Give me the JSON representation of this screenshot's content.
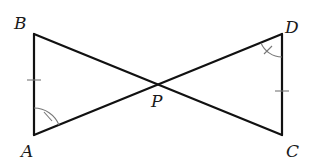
{
  "diagram": {
    "points": {
      "A": {
        "label": "A",
        "x": 34,
        "y": 135
      },
      "B": {
        "label": "B",
        "x": 34,
        "y": 34
      },
      "C": {
        "label": "C",
        "x": 282,
        "y": 135
      },
      "D": {
        "label": "D",
        "x": 282,
        "y": 34
      },
      "P": {
        "label": "P",
        "x": 158,
        "y": 84
      }
    },
    "segments": [
      {
        "from": "A",
        "to": "B"
      },
      {
        "from": "B",
        "to": "C"
      },
      {
        "from": "A",
        "to": "D"
      },
      {
        "from": "D",
        "to": "C"
      }
    ],
    "congruence_marks": {
      "sides": [
        {
          "side": "AB",
          "ticks": 1
        },
        {
          "side": "DC",
          "ticks": 1
        }
      ],
      "angles": [
        {
          "angle": "BAP",
          "vertex": "A",
          "ticks": 1
        },
        {
          "angle": "PDC",
          "vertex": "D",
          "ticks": 1
        }
      ]
    },
    "colors": {
      "line": "#111111",
      "mark": "#777777",
      "label": "#1a1a1a",
      "background": "#ffffff"
    }
  }
}
